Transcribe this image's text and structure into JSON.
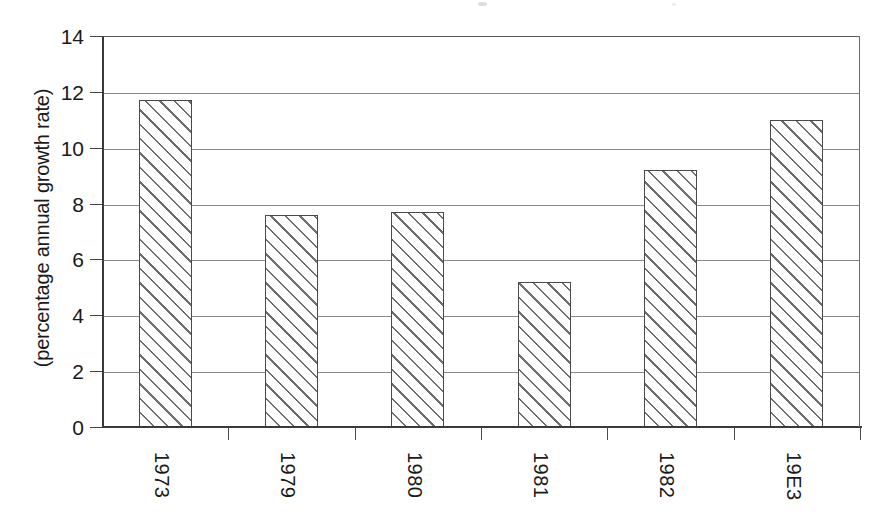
{
  "chart_data": {
    "type": "bar",
    "title": "",
    "subtitle": "",
    "xlabel": "",
    "ylabel": "(percentage annual growth rate)",
    "categories": [
      "1973",
      "1979",
      "1980",
      "1981",
      "1982",
      "19E3"
    ],
    "values": [
      11.7,
      7.6,
      7.7,
      5.2,
      9.2,
      11.0
    ],
    "series": [
      {
        "name": "percentage annual growth rate",
        "values": [
          11.7,
          7.6,
          7.7,
          5.2,
          9.2,
          11.0
        ]
      }
    ],
    "ylim": [
      0,
      14
    ],
    "ytick_labels": [
      "0",
      "2",
      "4",
      "6",
      "8",
      "10",
      "12",
      "14"
    ],
    "ytick_values": [
      0,
      2,
      4,
      6,
      8,
      10,
      12,
      14
    ],
    "xtick_labels": [
      "1973",
      "1979",
      "1980",
      "1981",
      "1982",
      "19E3"
    ],
    "grid": "horizontal",
    "legend": "none",
    "bar_fill": "diagonal-hatch",
    "bar_outline_color": "#4a4a4a",
    "hatch_color": "#6d6d6d",
    "gridline_color": "#8a8a8a",
    "axis_color": "#3a3a3a",
    "background_color": "#ffffff",
    "xtick_label_rotation": 90,
    "ylabel_rotation": -90
  }
}
